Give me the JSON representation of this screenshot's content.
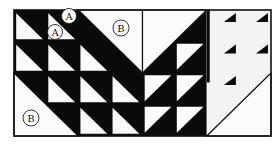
{
  "diagram": {
    "colors": {
      "dark": "#0a0a0a",
      "light": "#fbfbfb",
      "faded_light": "#f3f3f3",
      "outline": "#111111"
    },
    "frame": {
      "x": 14,
      "y": 10,
      "w": 257,
      "h": 126
    },
    "grid": {
      "cols": 8,
      "rows": 4,
      "cell": 32,
      "row_h": 31.5
    },
    "small_hst_cells": [
      {
        "c": 0,
        "r": 0,
        "dir": "tlbr"
      },
      {
        "c": 1,
        "r": 0,
        "dir": "tlbr"
      },
      {
        "c": 0,
        "r": 1,
        "dir": "tlbr"
      },
      {
        "c": 1,
        "r": 1,
        "dir": "tlbr"
      },
      {
        "c": 2,
        "r": 1,
        "dir": "tlbr"
      },
      {
        "c": 1,
        "r": 2,
        "dir": "tlbr"
      },
      {
        "c": 2,
        "r": 2,
        "dir": "tlbr"
      },
      {
        "c": 3,
        "r": 2,
        "dir": "tlbr"
      },
      {
        "c": 2,
        "r": 3,
        "dir": "tlbr"
      },
      {
        "c": 3,
        "r": 3,
        "dir": "tlbr"
      },
      {
        "c": 5,
        "r": 1,
        "dir": "bltr"
      },
      {
        "c": 4,
        "r": 2,
        "dir": "bltr"
      },
      {
        "c": 5,
        "r": 2,
        "dir": "bltr"
      },
      {
        "c": 4,
        "r": 3,
        "dir": "bltr"
      },
      {
        "c": 5,
        "r": 3,
        "dir": "bltr"
      }
    ],
    "large_triangles": [
      {
        "name": "large-light-triangle-top",
        "c": 2,
        "r": 0,
        "span": 2,
        "dir": "tlbr",
        "light_side": "upper"
      },
      {
        "name": "large-light-triangle-bottom-left",
        "c": 0,
        "r": 2,
        "span": 2,
        "dir": "tlbr",
        "light_side": "lower"
      },
      {
        "name": "large-light-triangle-top-middle",
        "c": 4,
        "r": 0,
        "span": 2,
        "dir": "bltr",
        "light_side": "upper"
      },
      {
        "name": "large-light-triangle-bottom-right",
        "c": 6,
        "r": 2,
        "span": 2,
        "dir": "bltr",
        "light_side": "lower"
      }
    ],
    "faded_tips": [
      {
        "c": 6,
        "r": 0
      },
      {
        "c": 7,
        "r": 0
      },
      {
        "c": 6,
        "r": 1
      },
      {
        "c": 7,
        "r": 1
      },
      {
        "c": 6,
        "r": 2
      }
    ],
    "labels": [
      {
        "text": "A",
        "cx": 69,
        "cy": 16,
        "r": 7.5
      },
      {
        "text": "A",
        "cx": 55,
        "cy": 32,
        "r": 7.5
      },
      {
        "text": "B",
        "cx": 121,
        "cy": 28,
        "r": 8
      },
      {
        "text": "B",
        "cx": 31,
        "cy": 118,
        "r": 8
      }
    ]
  }
}
